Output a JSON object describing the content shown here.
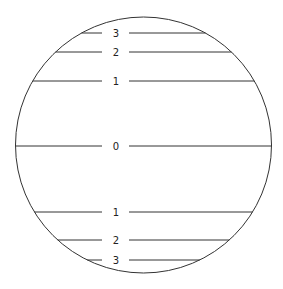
{
  "diagram": {
    "type": "circle-with-horizontal-levels",
    "circle": {
      "cx": 143.5,
      "cy": 145,
      "r": 128,
      "stroke": "#333333"
    },
    "label_x": 116,
    "gap": {
      "left_end": 102,
      "right_start": 129
    },
    "levels": [
      {
        "label": "3",
        "y": 33
      },
      {
        "label": "2",
        "y": 52
      },
      {
        "label": "1",
        "y": 81
      },
      {
        "label": "0",
        "y": 146
      },
      {
        "label": "1",
        "y": 212
      },
      {
        "label": "2",
        "y": 240
      },
      {
        "label": "3",
        "y": 260
      }
    ]
  }
}
